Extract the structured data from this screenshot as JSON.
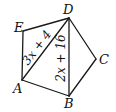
{
  "figure": {
    "type": "pentagon with diagonals",
    "stroke_color": "#1a1a1a",
    "background": "#ffffff",
    "vertices": [
      {
        "name": "D",
        "x": 69,
        "y": 18,
        "label_x": 63,
        "label_y": 14
      },
      {
        "name": "E",
        "x": 23,
        "y": 31,
        "label_x": 14,
        "label_y": 31
      },
      {
        "name": "A",
        "x": 22,
        "y": 80,
        "label_x": 13,
        "label_y": 93
      },
      {
        "name": "B",
        "x": 69,
        "y": 96,
        "label_x": 64,
        "label_y": 108
      },
      {
        "name": "C",
        "x": 96,
        "y": 59,
        "label_x": 99,
        "label_y": 64
      }
    ],
    "edges": [
      {
        "from": "E",
        "to": "D"
      },
      {
        "from": "D",
        "to": "C"
      },
      {
        "from": "C",
        "to": "B"
      },
      {
        "from": "B",
        "to": "A"
      },
      {
        "from": "A",
        "to": "E"
      },
      {
        "from": "A",
        "to": "D"
      },
      {
        "from": "D",
        "to": "B"
      }
    ],
    "segment_labels": [
      {
        "segment": "AD",
        "text": "3x + 4"
      },
      {
        "segment": "DB",
        "text": "2x + 16"
      }
    ]
  }
}
